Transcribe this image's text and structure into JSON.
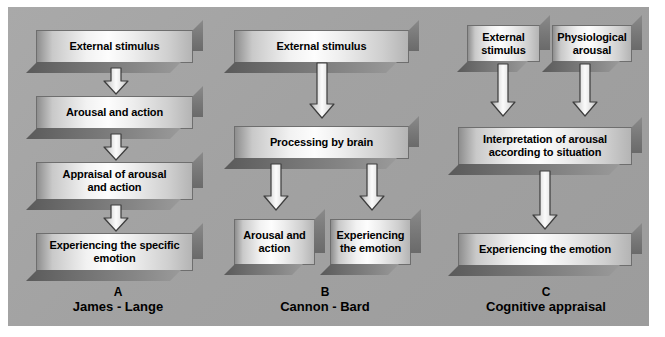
{
  "figure": {
    "background_color": "#a4a4a4",
    "page_color": "#ffffff",
    "box_text_color": "#000000"
  },
  "columns": [
    {
      "id": "a",
      "letter": "A",
      "name": "James - Lange",
      "boxes": [
        {
          "label": "External stimulus"
        },
        {
          "label": "Arousal and action"
        },
        {
          "label": "Appraisal of arousal\nand action"
        },
        {
          "label": "Experiencing the specific\nemotion"
        }
      ],
      "arrows": [
        {
          "name": "arrow-a-1",
          "direction": "down"
        },
        {
          "name": "arrow-a-2",
          "direction": "down"
        },
        {
          "name": "arrow-a-3",
          "direction": "down"
        }
      ]
    },
    {
      "id": "b",
      "letter": "B",
      "name": "Cannon - Bard",
      "boxes": [
        {
          "label": "External stimulus"
        },
        {
          "label": "Processing by brain"
        },
        {
          "label": "Arousal and\naction"
        },
        {
          "label": "Experiencing\nthe emotion"
        }
      ],
      "arrows": [
        {
          "name": "arrow-b-1",
          "direction": "down"
        },
        {
          "name": "arrow-b-2",
          "direction": "down"
        },
        {
          "name": "arrow-b-3",
          "direction": "down"
        }
      ]
    },
    {
      "id": "c",
      "letter": "C",
      "name": "Cognitive appraisal",
      "boxes": [
        {
          "label": "External\nstimulus"
        },
        {
          "label": "Physiological\narousal"
        },
        {
          "label": "Interpretation of arousal\naccording to situation"
        },
        {
          "label": "Experiencing the emotion"
        }
      ],
      "arrows": [
        {
          "name": "arrow-c-1",
          "direction": "down"
        },
        {
          "name": "arrow-c-2",
          "direction": "down"
        },
        {
          "name": "arrow-c-3",
          "direction": "down"
        }
      ]
    }
  ]
}
